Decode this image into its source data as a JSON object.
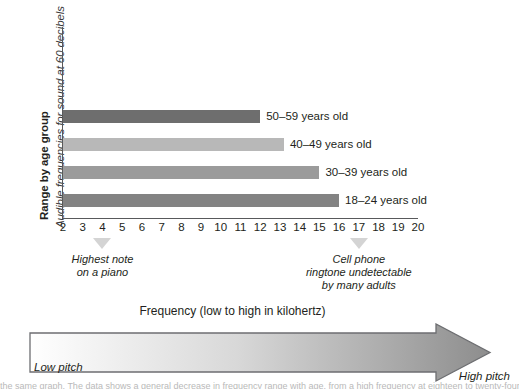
{
  "chart_data": {
    "type": "bar",
    "orientation": "horizontal",
    "title": "",
    "ylabel_bold": "Range by age group",
    "ylabel_italic": "Audible frequencies for sound at 60 decibels",
    "xlabel": "Frequency (low to high in kilohertz)",
    "xlim": [
      2,
      20
    ],
    "xunit": "kilohertz",
    "grid": false,
    "legend_position": "inline-right-of-bars",
    "categories": [
      "50–59 years old",
      "40–49 years old",
      "30–39 years old",
      "18–24 years old"
    ],
    "values": [
      12,
      13.2,
      15,
      16
    ],
    "bar_colors": [
      "#6e6e6e",
      "#b8b8b8",
      "#9b9b9b",
      "#838383"
    ],
    "xticks": [
      2,
      3,
      4,
      5,
      6,
      7,
      8,
      9,
      10,
      11,
      12,
      13,
      14,
      15,
      16,
      17,
      18,
      19,
      20
    ],
    "annotations": [
      {
        "x": 4,
        "text": "Highest note\non a piano"
      },
      {
        "x": 17,
        "text": "Cell phone\nringtone undetectable\nby many adults"
      }
    ],
    "series": [
      {
        "name": "50–59 years old",
        "value": 12,
        "color": "#6e6e6e"
      },
      {
        "name": "40–49 years old",
        "value": 13.2,
        "color": "#b8b8b8"
      },
      {
        "name": "30–39 years old",
        "value": 15,
        "color": "#9b9b9b"
      },
      {
        "name": "18–24 years old",
        "value": 16,
        "color": "#838383"
      }
    ]
  },
  "axis_titles": {
    "bold": "Range by age group",
    "italic": "Audible frequencies for sound at 60 decibels"
  },
  "ticks": [
    "2",
    "3",
    "4",
    "5",
    "6",
    "7",
    "8",
    "9",
    "10",
    "11",
    "12",
    "13",
    "14",
    "15",
    "16",
    "17",
    "18",
    "19",
    "20"
  ],
  "bars": [
    {
      "label": "50–59 years old",
      "value": 12,
      "color": "#6e6e6e"
    },
    {
      "label": "40–49 years old",
      "value": 13.2,
      "color": "#b8b8b8"
    },
    {
      "label": "30–39 years old",
      "value": 15,
      "color": "#9b9b9b"
    },
    {
      "label": "18–24 years old",
      "value": 16,
      "color": "#838383"
    }
  ],
  "annotations": {
    "piano": "Highest note\non a piano",
    "cellphone": "Cell phone\nringtone undetectable\nby many adults"
  },
  "band": {
    "title": "Frequency (low to high in kilohertz)",
    "low_label": "Low pitch",
    "high_label": "High pitch",
    "gradient_from": "#ffffff",
    "gradient_to": "#8d8d8d"
  },
  "caption_sliver": "the same graph. The data shows a general decrease in frequency range with age, from a high frequency at eighteen to twenty-four years old to a"
}
